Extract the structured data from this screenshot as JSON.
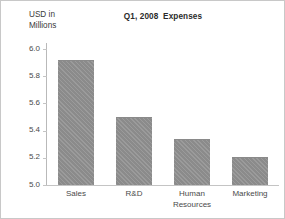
{
  "chart_data": {
    "type": "bar",
    "title": "Q1, 2008  Expenses",
    "ylabel_lines": [
      "USD in",
      "Millions"
    ],
    "xlabel": "",
    "categories": [
      "Sales",
      "R&D",
      "Human Resources",
      "Marketing"
    ],
    "category_label_lines": [
      [
        "Sales"
      ],
      [
        "R&D"
      ],
      [
        "Human",
        "Resources"
      ],
      [
        "Marketing"
      ]
    ],
    "values": [
      5.91,
      5.49,
      5.33,
      5.2
    ],
    "ylim": [
      5.0,
      6.0
    ],
    "yticks": [
      6.0,
      5.8,
      5.6,
      5.4,
      5.2,
      5.0
    ],
    "ytick_labels": [
      "6.0",
      "5.8",
      "5.6",
      "5.4",
      "5.2",
      "5.0"
    ],
    "grid": false,
    "legend": null,
    "bar_color": "#919191",
    "axis_color": "#c4c4c4",
    "text_color": "#4a4a4a"
  }
}
